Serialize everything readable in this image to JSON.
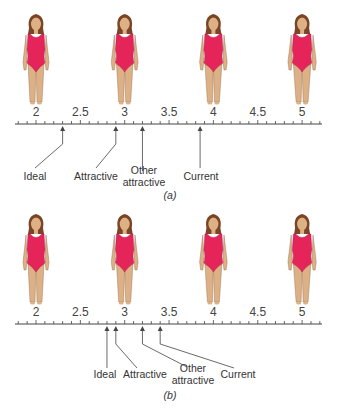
{
  "panels": [
    {
      "id": "a",
      "caption": "(a)",
      "axis_y": 124,
      "figure_top": 14,
      "tick_labels": [
        "2",
        "2.5",
        "3",
        "3.5",
        "4",
        "4.5",
        "5"
      ],
      "markers": [
        {
          "label_lines": [
            "Ideal"
          ],
          "value": 2.3,
          "label_x": 35,
          "label_y": 180,
          "elbow": true
        },
        {
          "label_lines": [
            "Attractive"
          ],
          "value": 2.9,
          "label_x": 96,
          "label_y": 180,
          "elbow": true
        },
        {
          "label_lines": [
            "Other",
            "attractive"
          ],
          "value": 3.2,
          "label_x": 144,
          "label_y": 174,
          "elbow": false
        },
        {
          "label_lines": [
            "Current"
          ],
          "value": 3.85,
          "label_x": 201,
          "label_y": 180,
          "elbow": false
        }
      ]
    },
    {
      "id": "b",
      "caption": "(b)",
      "axis_y": 324,
      "figure_top": 214,
      "tick_labels": [
        "2",
        "2.5",
        "3",
        "3.5",
        "4",
        "4.5",
        "5"
      ],
      "markers": [
        {
          "label_lines": [
            "Ideal"
          ],
          "value": 2.8,
          "label_x": 105,
          "label_y": 378
        },
        {
          "label_lines": [
            "Attractive"
          ],
          "value": 2.9,
          "label_x": 145,
          "label_y": 378
        },
        {
          "label_lines": [
            "Other",
            "attractive"
          ],
          "value": 3.2,
          "label_x": 193,
          "label_y": 372
        },
        {
          "label_lines": [
            "Current"
          ],
          "value": 3.4,
          "label_x": 238,
          "label_y": 378
        }
      ]
    }
  ],
  "figures": [
    {
      "size": 2
    },
    {
      "size": 3
    },
    {
      "size": 4
    },
    {
      "size": 5
    }
  ],
  "colors": {
    "swimsuit": "#e5245a",
    "skin": "#ddb085",
    "hair": "#7a4526",
    "axis": "#444444"
  }
}
